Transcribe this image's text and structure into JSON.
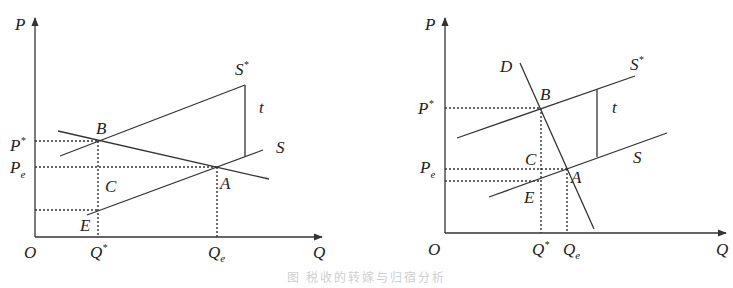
{
  "figure": {
    "caption": "图  税收的转嫁与归宿分析"
  },
  "left_panel": {
    "axes": {
      "y_label": "P",
      "x_label": "Q",
      "origin": "O"
    },
    "price_ticks": [
      {
        "base": "P",
        "mark": "*",
        "role": "P*"
      },
      {
        "base": "P",
        "mark": "e",
        "role": "Pe"
      }
    ],
    "quantity_ticks": [
      {
        "base": "Q",
        "mark": "*",
        "role": "Q*"
      },
      {
        "base": "Q",
        "mark": "e",
        "role": "Qe"
      }
    ],
    "curves": {
      "supply_after_tax": "S*",
      "supply": "S",
      "tax_gap": "t"
    },
    "points": [
      "B",
      "A",
      "C",
      "E"
    ]
  },
  "right_panel": {
    "axes": {
      "y_label": "P",
      "x_label": "Q",
      "origin": "O"
    },
    "price_ticks": [
      {
        "base": "P",
        "mark": "*",
        "role": "P*"
      },
      {
        "base": "P",
        "mark": "e",
        "role": "Pe"
      }
    ],
    "quantity_ticks": [
      {
        "base": "Q",
        "mark": "*",
        "role": "Q*"
      },
      {
        "base": "Q",
        "mark": "e",
        "role": "Qe"
      }
    ],
    "curves": {
      "demand": "D",
      "supply_after_tax": "S*",
      "supply": "S",
      "tax_gap": "t"
    },
    "points": [
      "B",
      "A",
      "C",
      "E"
    ]
  },
  "star_mark": "*"
}
